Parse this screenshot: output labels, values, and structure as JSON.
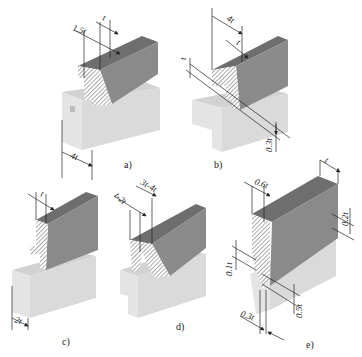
{
  "colors": {
    "background": "#ffffff",
    "upper_top": "#6e6e6e",
    "upper_front": "#8a8a8a",
    "upper_side": "#7b7b7b",
    "lower_top": "#d2d2d2",
    "lower_front": "#e4e4e4",
    "lower_side": "#dadada",
    "hatch": "#555555",
    "line": "#222222"
  },
  "figures": [
    {
      "id": "a",
      "caption": "a)",
      "dimensions": [
        "1.5t",
        "t",
        "4t"
      ]
    },
    {
      "id": "b",
      "caption": "b)",
      "dimensions": [
        "4t",
        "t",
        "t",
        "0.3t"
      ]
    },
    {
      "id": "c",
      "caption": "c)",
      "dimensions": [
        "t",
        "2t"
      ]
    },
    {
      "id": "d",
      "caption": "d)",
      "dimensions": [
        "t-2t",
        "3t-4t"
      ]
    },
    {
      "id": "e",
      "caption": "e)",
      "dimensions": [
        "t",
        "0.6t",
        "0.2t",
        "0.1t",
        "0.5t",
        "0.3t"
      ]
    }
  ]
}
